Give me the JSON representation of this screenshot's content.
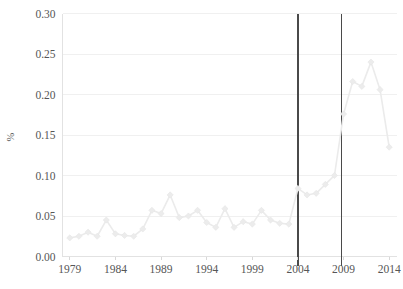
{
  "chart_data": {
    "type": "line",
    "title": "",
    "xlabel": "",
    "ylabel": "%",
    "xlim": [
      1978.2,
      2014.8
    ],
    "ylim": [
      0.0,
      0.3
    ],
    "grid": true,
    "legend": null,
    "x_tick_labels": [
      "1979",
      "1984",
      "1989",
      "1994",
      "1999",
      "2004",
      "2009",
      "2014"
    ],
    "x_ticks": [
      1979,
      1984,
      1989,
      1994,
      1999,
      2004,
      2009,
      2014
    ],
    "y_tick_labels": [
      "0.00",
      "0.05",
      "0.10",
      "0.15",
      "0.20",
      "0.25",
      "0.30"
    ],
    "y_ticks": [
      0.0,
      0.05,
      0.1,
      0.15,
      0.2,
      0.25,
      0.3
    ],
    "marker": "diamond",
    "line_color": "#ebebeb",
    "marker_color": "#ececec",
    "grid_color": "#f0f0f0",
    "axis_color": "#e2e2e2",
    "annotation_line_color": "#4a4a4a",
    "annotations": [
      {
        "type": "vline",
        "x": 2004.0,
        "label": ""
      },
      {
        "type": "vline",
        "x": 2008.8,
        "label": ""
      }
    ],
    "x": [
      1979,
      1980,
      1981,
      1982,
      1983,
      1984,
      1985,
      1986,
      1987,
      1988,
      1989,
      1990,
      1991,
      1992,
      1993,
      1994,
      1995,
      1996,
      1997,
      1998,
      1999,
      2000,
      2001,
      2002,
      2003,
      2004,
      2005,
      2006,
      2007,
      2008,
      2009,
      2010,
      2011,
      2012,
      2013,
      2014
    ],
    "values": [
      0.023,
      0.025,
      0.03,
      0.025,
      0.045,
      0.028,
      0.026,
      0.025,
      0.034,
      0.057,
      0.053,
      0.076,
      0.048,
      0.05,
      0.057,
      0.042,
      0.036,
      0.059,
      0.036,
      0.043,
      0.04,
      0.057,
      0.045,
      0.041,
      0.04,
      0.084,
      0.076,
      0.078,
      0.089,
      0.1,
      0.176,
      0.216,
      0.21,
      0.24,
      0.206,
      0.135
    ],
    "series": [
      {
        "name": "%",
        "x": [
          1979,
          1980,
          1981,
          1982,
          1983,
          1984,
          1985,
          1986,
          1987,
          1988,
          1989,
          1990,
          1991,
          1992,
          1993,
          1994,
          1995,
          1996,
          1997,
          1998,
          1999,
          2000,
          2001,
          2002,
          2003,
          2004,
          2005,
          2006,
          2007,
          2008,
          2009,
          2010,
          2011,
          2012,
          2013,
          2014
        ],
        "values": [
          0.023,
          0.025,
          0.03,
          0.025,
          0.045,
          0.028,
          0.026,
          0.025,
          0.034,
          0.057,
          0.053,
          0.076,
          0.048,
          0.05,
          0.057,
          0.042,
          0.036,
          0.059,
          0.036,
          0.043,
          0.04,
          0.057,
          0.045,
          0.041,
          0.04,
          0.084,
          0.076,
          0.078,
          0.089,
          0.1,
          0.176,
          0.216,
          0.21,
          0.24,
          0.206,
          0.135
        ]
      }
    ]
  }
}
